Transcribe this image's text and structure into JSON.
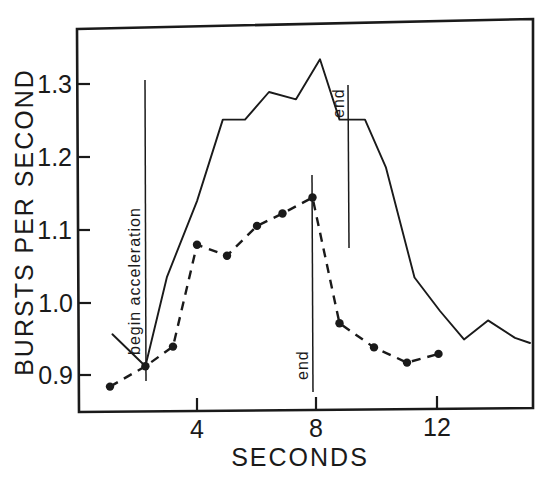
{
  "chart_data": {
    "type": "line",
    "title": "",
    "xlabel": "SECONDS",
    "ylabel": "BURSTS PER SECOND",
    "xlim": [
      1.0,
      15.2
    ],
    "ylim": [
      0.855,
      1.345
    ],
    "grid": false,
    "legend": "none",
    "xticks": [
      4,
      8,
      12
    ],
    "xtick_labels": [
      "4",
      "8",
      "12"
    ],
    "yticks": [
      0.9,
      1.0,
      1.1,
      1.2,
      1.3
    ],
    "ytick_labels": [
      "0.9",
      "1.0",
      "1.1",
      "1.2",
      "1.3"
    ],
    "series": [
      {
        "name": "solid-line-series",
        "style": "solid",
        "markers": false,
        "x": [
          1.18,
          2.28,
          3.0,
          4.0,
          4.86,
          5.6,
          6.4,
          7.3,
          8.1,
          8.75,
          9.6,
          10.3,
          11.25,
          12.1,
          12.9,
          13.7,
          14.6,
          15.1
        ],
        "y": [
          0.956,
          0.912,
          1.035,
          1.139,
          1.251,
          1.251,
          1.289,
          1.279,
          1.334,
          1.251,
          1.251,
          1.185,
          1.034,
          0.988,
          0.949,
          0.975,
          0.951,
          0.944
        ]
      },
      {
        "name": "dashed-line-series",
        "style": "dashed",
        "markers": true,
        "x": [
          1.1,
          2.28,
          3.2,
          4.0,
          5.0,
          6.0,
          6.85,
          7.85,
          8.75,
          9.9,
          11.0,
          12.05
        ],
        "y": [
          0.884,
          0.912,
          0.939,
          1.079,
          1.064,
          1.105,
          1.122,
          1.144,
          0.971,
          0.938,
          0.917,
          0.929
        ]
      }
    ],
    "annotations": [
      {
        "name": "begin-acceleration",
        "label": "begin  acceleration",
        "orientation": "vertical-rotated",
        "x": 2.28,
        "y_top": 1.315,
        "y_bottom": 0.895
      },
      {
        "name": "end-dashed",
        "label": "end",
        "orientation": "vertical-rotated",
        "x": 7.87,
        "y_top": 1.17,
        "y_bottom": 0.877
      },
      {
        "name": "end-solid",
        "label": "end",
        "orientation": "vertical-rotated",
        "x": 9.07,
        "y_top": 1.3,
        "y_bottom": 1.075
      }
    ]
  },
  "axes": {
    "y_title": "BURSTS PER SECOND",
    "x_title": "SECONDS",
    "ytick_1": "1.3",
    "ytick_2": "1.2",
    "ytick_3": "1.1",
    "ytick_4": "1.0",
    "ytick_5": "0.9",
    "xtick_1": "4",
    "xtick_2": "8",
    "xtick_3": "12"
  },
  "annotations": {
    "begin_acceleration": "begin  acceleration",
    "end_lower": "end",
    "end_upper": "end"
  },
  "colors": {
    "ink": "#1a1a1a",
    "background": "#ffffff"
  }
}
